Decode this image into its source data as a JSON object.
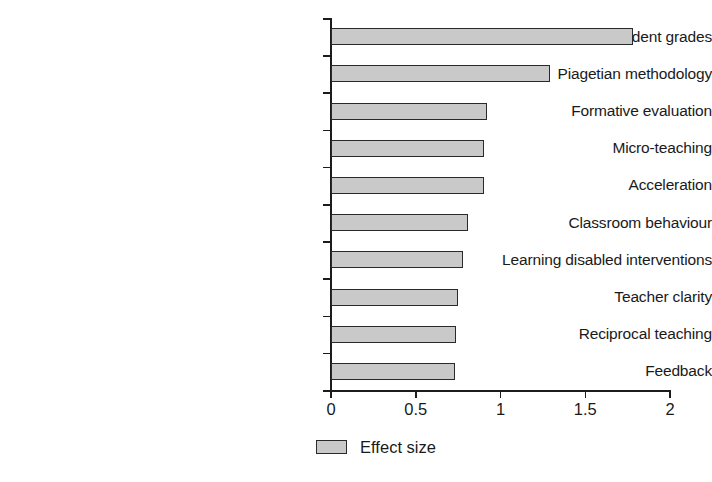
{
  "chart_data": {
    "type": "bar",
    "orientation": "horizontal",
    "title": "",
    "xlabel": "",
    "ylabel": "",
    "xlim": [
      0,
      2
    ],
    "xticks": [
      0,
      0.5,
      1,
      1.5,
      2
    ],
    "xtick_labels": [
      "0",
      "0.5",
      "1",
      "1.5",
      "2"
    ],
    "grid": false,
    "legend": {
      "position": "bottom-center",
      "entries": [
        {
          "label": "Effect size",
          "color": "#c9c9c9",
          "edge_color": "#2a2a2a"
        }
      ]
    },
    "categories": [
      "Student grades",
      "Piagetian methodology",
      "Formative evaluation",
      "Micro-teaching",
      "Acceleration",
      "Classroom behaviour",
      "Learning disabled interventions",
      "Teacher clarity",
      "Reciprocal teaching",
      "Feedback"
    ],
    "series": [
      {
        "name": "Effect size",
        "values": [
          1.78,
          1.29,
          0.92,
          0.9,
          0.9,
          0.81,
          0.78,
          0.75,
          0.74,
          0.73
        ]
      }
    ]
  },
  "style": {
    "bar_fill": "#c9c9c9",
    "bar_edge": "#2a2a2a",
    "axis_color": "#1c1c1c",
    "text_color": "#1a1a1a",
    "background": "#ffffff"
  }
}
